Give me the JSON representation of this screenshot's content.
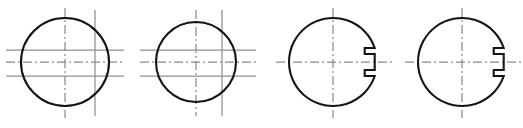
{
  "sheet": {
    "title": "Circular shaft cross-section views",
    "width": 523,
    "height": 128,
    "background_color": "#ffffff",
    "outline_color": "#141414",
    "centerline_color": "#8c8c8c",
    "construction_line_color": "#8f8f8f",
    "outline_stroke_width": 2.1,
    "centerline_stroke_width": 1.25
  },
  "figures": [
    {
      "id": "figure-1",
      "label": "",
      "type": "circle",
      "center_x": 65,
      "center_y": 62,
      "radius": 44,
      "has_keyway": false,
      "vertical_lines": [
        {
          "x": 65,
          "y1": 8,
          "y2": 118,
          "kind": "centerline"
        },
        {
          "x": 95,
          "y1": 10,
          "y2": 116,
          "kind": "construction"
        }
      ],
      "horizontal_lines": [
        {
          "y": 50,
          "x1": 6,
          "x2": 124,
          "kind": "construction"
        },
        {
          "y": 62,
          "x1": 6,
          "x2": 124,
          "kind": "centerline"
        },
        {
          "y": 76,
          "x1": 6,
          "x2": 124,
          "kind": "construction"
        }
      ]
    },
    {
      "id": "figure-2",
      "label": "",
      "type": "circle",
      "center_x": 196,
      "center_y": 62,
      "radius": 40,
      "has_keyway": false,
      "vertical_lines": [
        {
          "x": 196,
          "y1": 10,
          "y2": 116,
          "kind": "centerline"
        },
        {
          "x": 222,
          "y1": 10,
          "y2": 116,
          "kind": "construction"
        }
      ],
      "horizontal_lines": [
        {
          "y": 50,
          "x1": 140,
          "x2": 256,
          "kind": "construction"
        },
        {
          "y": 62,
          "x1": 140,
          "x2": 256,
          "kind": "centerline"
        },
        {
          "y": 76,
          "x1": 140,
          "x2": 256,
          "kind": "construction"
        }
      ]
    },
    {
      "id": "figure-3",
      "label": "",
      "type": "circle-with-keyway",
      "center_x": 333,
      "center_y": 62,
      "radius": 44,
      "has_keyway": true,
      "keyway": {
        "side": "right",
        "mouth_half_height": 14,
        "depth": 10,
        "throat_half_height": 8
      },
      "vertical_lines": [
        {
          "x": 333,
          "y1": 8,
          "y2": 118,
          "kind": "centerline"
        }
      ],
      "horizontal_lines": [
        {
          "y": 62,
          "x1": 276,
          "x2": 392,
          "kind": "centerline"
        }
      ]
    },
    {
      "id": "figure-4",
      "label": "",
      "type": "circle-with-keyway",
      "center_x": 462,
      "center_y": 62,
      "radius": 44,
      "has_keyway": true,
      "keyway": {
        "side": "right",
        "mouth_half_height": 14,
        "depth": 10,
        "throat_half_height": 8
      },
      "vertical_lines": [
        {
          "x": 462,
          "y1": 8,
          "y2": 118,
          "kind": "centerline"
        }
      ],
      "horizontal_lines": [
        {
          "y": 62,
          "x1": 405,
          "x2": 521,
          "kind": "centerline"
        }
      ]
    }
  ]
}
